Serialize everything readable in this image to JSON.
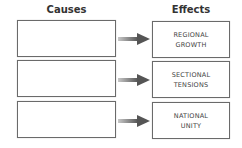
{
  "headers": {
    "causes": "Causes",
    "effects": "Effects"
  },
  "rows": [
    {
      "cause": "",
      "effect_line1": "REGIONAL",
      "effect_line2": "GROWTH"
    },
    {
      "cause": "",
      "effect_line1": "SECTIONAL",
      "effect_line2": "TENSIONS"
    },
    {
      "cause": "",
      "effect_line1": "NATIONAL",
      "effect_line2": "UNITY"
    }
  ],
  "colors": {
    "border": "#6a6a6a",
    "arrow": "#555555",
    "text": "#444444"
  }
}
